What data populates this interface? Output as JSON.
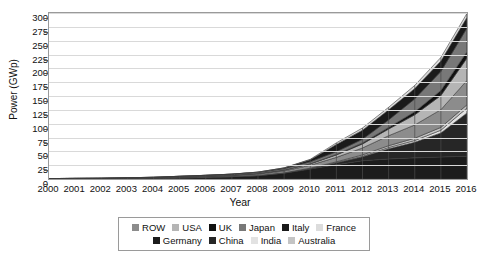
{
  "chart_data": {
    "type": "area",
    "title": "",
    "xlabel": "Year",
    "ylabel": "Power (GWp)",
    "xlim": [
      2000,
      2016
    ],
    "ylim": [
      0,
      300
    ],
    "ytick_step": 25,
    "grid": true,
    "legend_position": "bottom",
    "stacked": true,
    "categories": [
      2000,
      2001,
      2002,
      2003,
      2004,
      2005,
      2006,
      2007,
      2008,
      2009,
      2010,
      2011,
      2012,
      2013,
      2014,
      2015,
      2016
    ],
    "x_tick_labels": [
      "2000",
      "2001",
      "2002",
      "2003",
      "2004",
      "2005",
      "2006",
      "2007",
      "2008",
      "2009",
      "2010",
      "2011",
      "2012",
      "2013",
      "2014",
      "2015",
      "2016"
    ],
    "y_tick_labels": [
      "0",
      "25",
      "50",
      "75",
      "100",
      "125",
      "150",
      "175",
      "200",
      "225",
      "250",
      "275",
      "300"
    ],
    "series": [
      {
        "name": "Germany",
        "color": "#1c1c1c",
        "values": [
          0.1,
          0.2,
          0.3,
          0.4,
          0.8,
          1.9,
          2.9,
          4.2,
          6.1,
          10.6,
          18.0,
          25.9,
          33.0,
          36.3,
          38.2,
          39.7,
          41.2
        ]
      },
      {
        "name": "China",
        "color": "#262626",
        "values": [
          0.0,
          0.0,
          0.0,
          0.1,
          0.1,
          0.1,
          0.1,
          0.1,
          0.2,
          0.3,
          0.9,
          3.3,
          7.0,
          18.3,
          28.2,
          43.5,
          78.1
        ]
      },
      {
        "name": "India",
        "color": "#e2e2e2",
        "values": [
          0.0,
          0.0,
          0.0,
          0.0,
          0.0,
          0.0,
          0.0,
          0.0,
          0.0,
          0.0,
          0.1,
          0.5,
          1.2,
          2.3,
          3.2,
          5.0,
          9.0
        ]
      },
      {
        "name": "Australia",
        "color": "#c4c4c4",
        "values": [
          0.0,
          0.0,
          0.0,
          0.0,
          0.0,
          0.1,
          0.1,
          0.1,
          0.1,
          0.2,
          0.6,
          1.4,
          2.4,
          3.3,
          4.1,
          5.1,
          5.9
        ]
      },
      {
        "name": "ROW",
        "color": "#8c8c8c",
        "values": [
          0.2,
          0.3,
          0.4,
          0.5,
          0.7,
          0.9,
          1.2,
          1.6,
          2.3,
          3.4,
          5.3,
          8.0,
          12.5,
          18.0,
          24.0,
          32.0,
          44.0
        ]
      },
      {
        "name": "USA",
        "color": "#b5b5b5",
        "values": [
          0.1,
          0.2,
          0.2,
          0.3,
          0.4,
          0.5,
          0.6,
          0.8,
          1.2,
          1.6,
          2.5,
          4.4,
          7.3,
          12.1,
          18.3,
          25.6,
          40.3
        ]
      },
      {
        "name": "UK",
        "color": "#111111",
        "values": [
          0.0,
          0.0,
          0.0,
          0.0,
          0.0,
          0.0,
          0.0,
          0.0,
          0.0,
          0.0,
          0.1,
          1.0,
          1.8,
          2.9,
          5.5,
          9.1,
          11.6
        ]
      },
      {
        "name": "Japan",
        "color": "#787878",
        "values": [
          0.3,
          0.5,
          0.6,
          0.9,
          1.1,
          1.4,
          1.7,
          1.9,
          2.1,
          2.6,
          3.6,
          4.9,
          6.6,
          13.6,
          23.3,
          34.2,
          42.8
        ]
      },
      {
        "name": "Italy",
        "color": "#1a1a1a",
        "values": [
          0.0,
          0.0,
          0.0,
          0.0,
          0.0,
          0.0,
          0.1,
          0.1,
          0.4,
          1.2,
          3.5,
          13.1,
          16.4,
          18.2,
          18.6,
          18.9,
          19.3
        ]
      },
      {
        "name": "France",
        "color": "#dcdcdc",
        "values": [
          0.0,
          0.0,
          0.0,
          0.0,
          0.0,
          0.0,
          0.0,
          0.0,
          0.1,
          0.3,
          1.0,
          2.8,
          4.0,
          4.6,
          5.7,
          6.6,
          7.1
        ]
      }
    ],
    "totals": [
      0.7,
      1.2,
      1.5,
      2.2,
      3.1,
      4.9,
      6.7,
      8.8,
      12.5,
      20.2,
      35.6,
      65.3,
      92.2,
      129.6,
      169.1,
      219.7,
      299.3
    ]
  },
  "legend": {
    "row1": [
      {
        "label": "ROW",
        "color": "#8c8c8c"
      },
      {
        "label": "USA",
        "color": "#b5b5b5"
      },
      {
        "label": "UK",
        "color": "#111111"
      },
      {
        "label": "Japan",
        "color": "#787878"
      },
      {
        "label": "Italy",
        "color": "#1a1a1a"
      },
      {
        "label": "France",
        "color": "#dcdcdc"
      }
    ],
    "row2": [
      {
        "label": "Germany",
        "color": "#1c1c1c"
      },
      {
        "label": "China",
        "color": "#262626"
      },
      {
        "label": "India",
        "color": "#e2e2e2"
      },
      {
        "label": "Australia",
        "color": "#c4c4c4"
      }
    ]
  }
}
